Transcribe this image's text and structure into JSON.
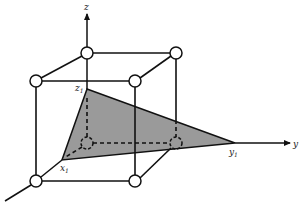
{
  "figure": {
    "colors": {
      "line": "#111111",
      "fill_triangle": "#9a9a9a",
      "background": "#ffffff"
    },
    "axes": {
      "x": {
        "label": "x",
        "label_visible": false
      },
      "y": {
        "label": "y"
      },
      "z": {
        "label": "z"
      }
    },
    "intercepts": {
      "x1": {
        "base": "x",
        "sub": "1"
      },
      "y1": {
        "base": "y",
        "sub": "1"
      },
      "z1": {
        "base": "z",
        "sub": "1"
      }
    },
    "cube": {
      "vertex_markers": "open-circles",
      "vertex_count": 8
    }
  }
}
